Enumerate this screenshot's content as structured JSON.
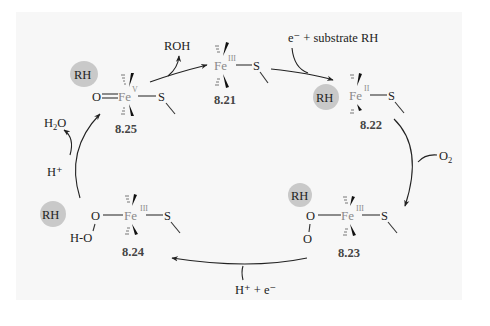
{
  "diagram": {
    "title": "",
    "type": "catalytic cycle",
    "colors": {
      "background": "#ffffff",
      "panel": "#f7f7f7",
      "substrate_blob": "#c9c9c9",
      "iron_text": "#8a8a8a",
      "ink": "#222222"
    },
    "substrate_label": "RH",
    "nodes": [
      {
        "id": "8.21",
        "label": "8.21",
        "metal": "Fe",
        "oxidation_state": "III",
        "ligands": [
          "S"
        ],
        "has_substrate": false
      },
      {
        "id": "8.22",
        "label": "8.22",
        "metal": "Fe",
        "oxidation_state": "II",
        "ligands": [
          "S"
        ],
        "has_substrate": true
      },
      {
        "id": "8.23",
        "label": "8.23",
        "metal": "Fe",
        "oxidation_state": "III",
        "ligands": [
          "O",
          "O",
          "S"
        ],
        "has_substrate": true
      },
      {
        "id": "8.24",
        "label": "8.24",
        "metal": "Fe",
        "oxidation_state": "III",
        "ligands": [
          "O",
          "H-O",
          "S"
        ],
        "has_substrate": true
      },
      {
        "id": "8.25",
        "label": "8.25",
        "metal": "Fe",
        "oxidation_state": "V",
        "ligands": [
          "O",
          "S"
        ],
        "has_substrate": true
      }
    ],
    "atoms": {
      "O": "O",
      "S": "S",
      "HO": "H-O"
    },
    "edges": [
      {
        "from": "8.21",
        "to": "8.22",
        "reagent_in": "e⁻ + substrate RH",
        "reagent_out": ""
      },
      {
        "from": "8.22",
        "to": "8.23",
        "reagent_in": "O",
        "reagent_in_sub": "2",
        "reagent_out": ""
      },
      {
        "from": "8.23",
        "to": "8.24",
        "reagent_in": "H⁺  +  e⁻",
        "reagent_out": ""
      },
      {
        "from": "8.24",
        "to": "8.25",
        "reagent_in": "H⁺",
        "reagent_out": "H",
        "reagent_out_sub": "2",
        "reagent_out_tail": "O"
      },
      {
        "from": "8.25",
        "to": "8.21",
        "reagent_in": "",
        "reagent_out": "ROH"
      }
    ],
    "reagents": {
      "top_right": "e⁻ + substrate RH",
      "o2_main": "O",
      "o2_sub": "2",
      "bottom": "H⁺  +  e⁻",
      "h_plus": "H⁺",
      "h2o_h": "H",
      "h2o_sub": "2",
      "h2o_o": "O",
      "roh": "ROH"
    }
  }
}
